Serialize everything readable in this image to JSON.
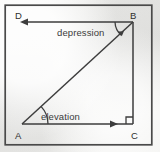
{
  "figure": {
    "kind": "geometry-diagram",
    "title_text": "",
    "background_color": "#f2f2f0",
    "stroke_color": "#404040",
    "frame": {
      "x": 5,
      "y": 5,
      "width": 147,
      "height": 140,
      "stroke_width": 1.6
    }
  },
  "labels": {
    "depression": "depression",
    "elevation": "elevation"
  },
  "vertices": {
    "d": "D",
    "b": "B",
    "a": "A",
    "c": "C"
  },
  "geometry": {
    "points": {
      "D": {
        "x": 22,
        "y": 22
      },
      "B": {
        "x": 133,
        "y": 22
      },
      "A": {
        "x": 22,
        "y": 124
      },
      "C": {
        "x": 133,
        "y": 124
      }
    },
    "segments": [
      {
        "name": "DB",
        "from": "B",
        "to": "D",
        "arrow": "to-D",
        "arrow_direction": "left"
      },
      {
        "name": "AB",
        "from": "A",
        "to": "B",
        "arrow": "none"
      },
      {
        "name": "BC",
        "from": "B",
        "to": "C",
        "arrow": "none"
      },
      {
        "name": "AC",
        "from": "A",
        "to": "C",
        "arrow": "to-C",
        "arrow_direction": "right"
      }
    ],
    "angle_marks": [
      {
        "name": "depression-angle",
        "at": "B",
        "label": "depression"
      },
      {
        "name": "elevation-angle",
        "at": "A",
        "label": "elevation"
      },
      {
        "name": "right-angle",
        "at": "C",
        "label": ""
      }
    ]
  }
}
